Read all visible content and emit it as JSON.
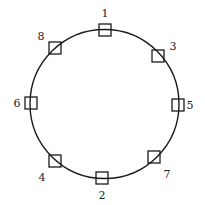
{
  "diagram": {
    "type": "ring",
    "circle": {
      "cx": 104.5,
      "cy": 104,
      "r": 74.5,
      "stroke": "#1a1a1a"
    },
    "node_size": 12,
    "nodes": [
      {
        "id": "1",
        "label": "1",
        "x": 105,
        "y": 30,
        "lx": 105,
        "ly": 17
      },
      {
        "id": "3",
        "label": "3",
        "x": 158,
        "y": 56,
        "lx": 173,
        "ly": 50
      },
      {
        "id": "5",
        "label": "5",
        "x": 178,
        "y": 105,
        "lx": 190,
        "ly": 109
      },
      {
        "id": "7",
        "label": "7",
        "x": 154,
        "y": 157,
        "lx": 167,
        "ly": 178
      },
      {
        "id": "2",
        "label": "2",
        "x": 102,
        "y": 178,
        "lx": 102,
        "ly": 199
      },
      {
        "id": "4",
        "label": "4",
        "x": 55,
        "y": 161,
        "lx": 42,
        "ly": 181
      },
      {
        "id": "6",
        "label": "6",
        "x": 31,
        "y": 103,
        "lx": 17,
        "ly": 107
      },
      {
        "id": "8",
        "label": "8",
        "x": 55,
        "y": 48,
        "lx": 41,
        "ly": 40
      }
    ]
  }
}
